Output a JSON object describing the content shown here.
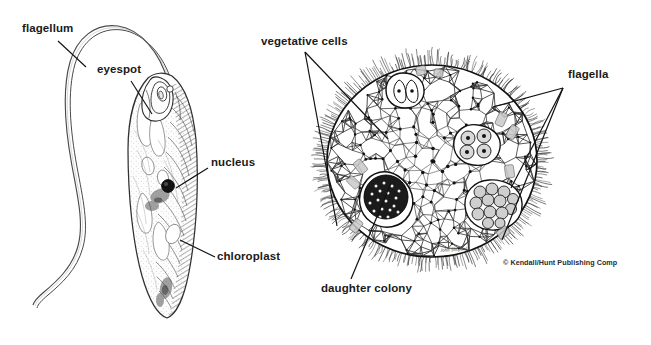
{
  "figure": {
    "kind": "scientific-line-drawing",
    "width": 651,
    "height": 345,
    "background_color": "#ffffff",
    "ink_color": "#1a1a1a",
    "panels": [
      {
        "name": "euglena",
        "subject": "Euglena single cell with flagellum",
        "labels": [
          "flagellum",
          "eyespot",
          "nucleus",
          "chloroplast"
        ]
      },
      {
        "name": "volvox",
        "subject": "Volvox spherical colony with daughter colonies",
        "labels": [
          "vegetative cells",
          "flagella",
          "daughter colony"
        ]
      }
    ]
  },
  "labels": {
    "flagellum": "flagellum",
    "eyespot": "eyespot",
    "nucleus": "nucleus",
    "chloroplast": "chloroplast",
    "vegetative_cells": "vegetative cells",
    "flagella": "flagella",
    "daughter_colony": "daughter colony"
  },
  "credit": {
    "text": "© Kendall/Hunt Publishing Comp",
    "artist_signature": "John Shepard"
  }
}
